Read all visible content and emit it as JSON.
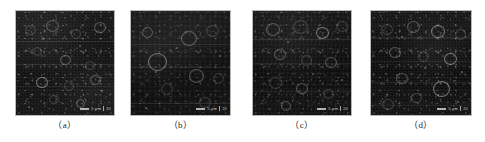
{
  "figure": {
    "background_color": "#ffffff",
    "panel_border_color": "#b9b9b4",
    "caption_color": "#2b2b2b",
    "panel_count": 4
  },
  "panels": [
    {
      "id": "panel-a",
      "caption": "（a）",
      "scalebar": {
        "label": "5 μm",
        "right_mark": "20"
      },
      "x": 15,
      "y": 10,
      "width": 100,
      "height": 106,
      "caption_x": 15,
      "caption_y": 120,
      "caption_width": 100,
      "texture": "fine-granular",
      "mean_color": "#121212"
    },
    {
      "id": "panel-b",
      "caption": "（b）",
      "scalebar": {
        "label": "5 μm",
        "right_mark": "20"
      },
      "x": 130,
      "y": 10,
      "width": 101,
      "height": 106,
      "caption_x": 130,
      "caption_y": 120,
      "caption_width": 101,
      "texture": "smooth-with-rings",
      "mean_color": "#131313"
    },
    {
      "id": "panel-c",
      "caption": "（c）",
      "scalebar": {
        "label": "5 μm",
        "right_mark": "20"
      },
      "x": 252,
      "y": 10,
      "width": 100,
      "height": 106,
      "caption_x": 252,
      "caption_y": 120,
      "caption_width": 100,
      "texture": "medium-granular",
      "mean_color": "#101010"
    },
    {
      "id": "panel-d",
      "caption": "（d）",
      "scalebar": {
        "label": "5 μm",
        "right_mark": "20"
      },
      "x": 370,
      "y": 10,
      "width": 102,
      "height": 106,
      "caption_x": 370,
      "caption_y": 120,
      "caption_width": 102,
      "texture": "dense-granular",
      "mean_color": "#0d0d0d"
    }
  ]
}
